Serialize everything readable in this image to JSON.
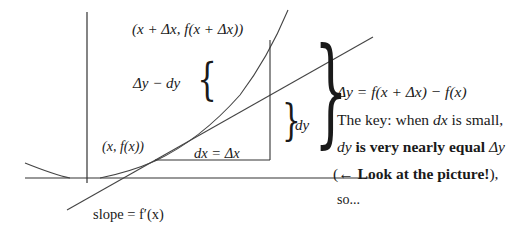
{
  "diagram": {
    "labels": {
      "point_upper": "(x + Δx, f(x + Δx))",
      "point_lower": "(x, f(x))",
      "delta_y_minus_dy": "Δy − dy",
      "dx_eq_delta_x": "dx = Δx",
      "dy": "dy",
      "slope": "slope = f′(x)",
      "delta_y_def": "Δy = f(x + Δx) − f(x)"
    },
    "explanation": {
      "line1_pre": "The key: when ",
      "line1_var": "dx",
      "line1_post": " is small,",
      "line2_var": "dy",
      "line2_bold": " is very nearly equal ",
      "line2_end": "Δy",
      "line3_open": "(← ",
      "line3_bold": "Look at the picture!",
      "line3_close": "),",
      "line4": "so..."
    },
    "colors": {
      "ink": "#1a1a1a",
      "background": "#ffffff"
    }
  }
}
